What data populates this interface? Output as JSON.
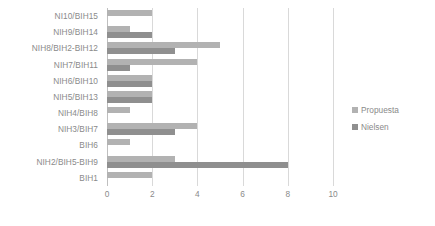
{
  "chart_data": {
    "type": "bar",
    "orientation": "horizontal",
    "title": "",
    "xlabel": "",
    "ylabel": "",
    "categories": [
      "NI10/BIH15",
      "NIH9/BIH14",
      "NIH8/BIH2-BIH12",
      "NIH7/BIH11",
      "NIH6/BIH10",
      "NIH5/BIH13",
      "NIH4/BIH8",
      "NIH3/BIH7",
      "BIH6",
      "NIH2/BIH5-BIH9",
      "BIH1"
    ],
    "series": [
      {
        "name": "Propuesta",
        "color": "#b2b2b2",
        "values": [
          2,
          1,
          5,
          4,
          2,
          2,
          1,
          4,
          1,
          3,
          2
        ]
      },
      {
        "name": "Nielsen",
        "color": "#8f8f8f",
        "values": [
          0,
          2,
          3,
          1,
          2,
          2,
          0,
          3,
          0,
          8,
          0
        ]
      }
    ],
    "xticks": [
      0,
      2,
      4,
      6,
      8,
      10
    ],
    "xtick_labels": [
      "0",
      "2",
      "4",
      "6",
      "8",
      "10"
    ],
    "xlim": [
      0,
      10
    ],
    "grid": true,
    "legend_position": "right"
  },
  "legend": {
    "items": [
      {
        "label": "Propuesta"
      },
      {
        "label": "Nielsen"
      }
    ]
  }
}
